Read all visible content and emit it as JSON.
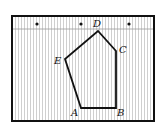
{
  "diagram": {
    "type": "pentagon-on-lined-grid",
    "frame": {
      "x": 12,
      "y": 16,
      "width": 142,
      "height": 105,
      "stroke": "#111111"
    },
    "header_line_y": 29,
    "stripe_color": "#c8c8c8",
    "dots": [
      {
        "x": 37,
        "y": 24
      },
      {
        "x": 81,
        "y": 24
      },
      {
        "x": 129,
        "y": 24
      }
    ],
    "vertices": [
      {
        "name": "A",
        "x": 81,
        "y": 108,
        "label_x": 71,
        "label_y": 116
      },
      {
        "name": "B",
        "x": 116,
        "y": 108,
        "label_x": 117,
        "label_y": 116
      },
      {
        "name": "C",
        "x": 116,
        "y": 51,
        "label_x": 119,
        "label_y": 53
      },
      {
        "name": "D",
        "x": 98,
        "y": 31,
        "label_x": 93,
        "label_y": 27
      },
      {
        "name": "E",
        "x": 65,
        "y": 59,
        "label_x": 54,
        "label_y": 64
      }
    ],
    "labels": {
      "A": "A",
      "B": "B",
      "C": "C",
      "D": "D",
      "E": "E"
    },
    "polygon_stroke": "#111111"
  }
}
